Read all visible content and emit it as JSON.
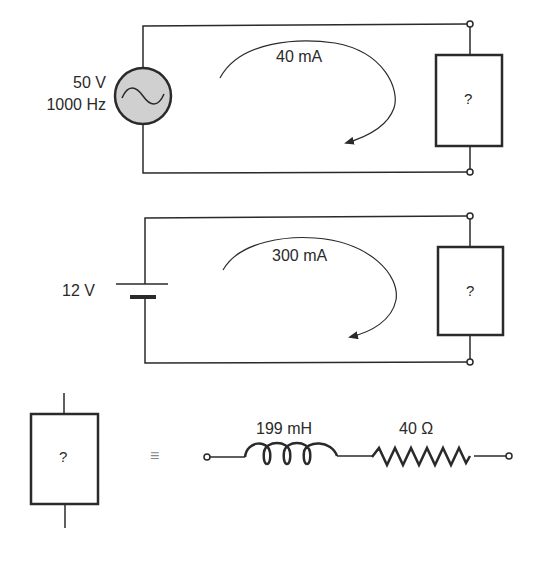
{
  "figure": {
    "circuit_ac": {
      "source_type": "AC voltage source",
      "voltage_label": "50 V",
      "frequency_label": "1000 Hz",
      "current_label": "40 mA",
      "load_label": "?"
    },
    "circuit_dc": {
      "source_type": "DC battery",
      "voltage_label": "12 V",
      "current_label": "300 mA",
      "load_label": "?"
    },
    "equivalence": {
      "block_label": "?",
      "equals_symbol": "≡",
      "inductor_label": "199 mH",
      "resistor_label": "40 Ω"
    },
    "colors": {
      "line": "#2a2a2a",
      "source_fill": "#d0d0d0"
    }
  }
}
